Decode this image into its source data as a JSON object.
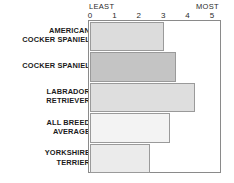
{
  "chart_data": {
    "type": "bar",
    "orientation": "horizontal",
    "title": "",
    "xlabel": "",
    "ylabel": "",
    "categories": [
      "AMERICAN COCKER SPANIEL",
      "COCKER SPANIEL",
      "LABRADOR RETRIEVER",
      "ALL BREED AVERAGE",
      "YORKSHIRE TERRIER"
    ],
    "values": [
      3.0,
      3.5,
      4.25,
      3.25,
      2.4
    ],
    "xlim": [
      0,
      5
    ],
    "xticks": [
      0,
      1,
      2,
      3,
      4,
      5
    ],
    "xtick_labels": [
      "0",
      "1",
      "2",
      "3",
      "4",
      "5"
    ],
    "axis_endpoint_labels": {
      "low": "LEAST",
      "high": "MOST"
    },
    "grid": false,
    "legend": false,
    "bar_colors": [
      "#dcdcdc",
      "#c4c4c4",
      "#dedede",
      "#f3f3f3",
      "#ebebeb"
    ]
  },
  "axis": {
    "least": "LEAST",
    "most": "MOST",
    "ticks": [
      {
        "label": "0",
        "value": 0
      },
      {
        "label": "1",
        "value": 1
      },
      {
        "label": "2",
        "value": 2
      },
      {
        "label": "3",
        "value": 3
      },
      {
        "label": "4",
        "value": 4
      },
      {
        "label": "5",
        "value": 5
      }
    ]
  },
  "rows": [
    {
      "label_lines": [
        "AMERICAN",
        "COCKER SPANIEL"
      ],
      "value": 3.0,
      "color": "#dcdcdc"
    },
    {
      "label_lines": [
        "COCKER SPANIEL"
      ],
      "value": 3.5,
      "color": "#c4c4c4"
    },
    {
      "label_lines": [
        "LABRADOR",
        "RETRIEVER"
      ],
      "value": 4.25,
      "color": "#dedede"
    },
    {
      "label_lines": [
        "ALL BREED",
        "AVERAGE"
      ],
      "value": 3.25,
      "color": "#f3f3f3"
    },
    {
      "label_lines": [
        "YORKSHIRE",
        "TERRIER"
      ],
      "value": 2.4,
      "color": "#ebebeb"
    }
  ],
  "colors": {
    "frame": "#8a8a8a",
    "bar_border": "#9a9a9a",
    "text": "#1b1b1b",
    "axis_text": "#2b2b2b",
    "background": "#ffffff"
  }
}
